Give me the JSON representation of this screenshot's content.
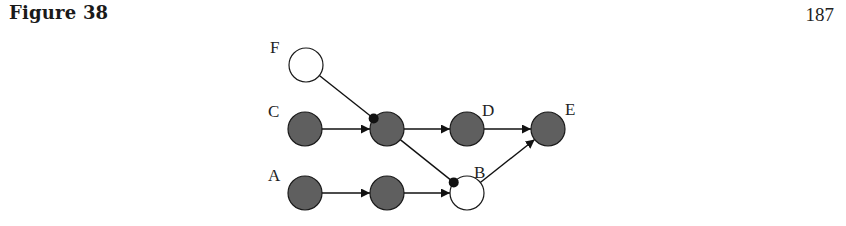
{
  "header": {
    "figure_title": "Figure 38",
    "page_number": "187"
  },
  "diagram": {
    "colors": {
      "filled": "#5f5f5f",
      "empty": "#ffffff",
      "stroke": "#1a1a1a"
    },
    "nodes": [
      {
        "id": "F",
        "label": "F",
        "x": 306,
        "y": 65,
        "filled": false
      },
      {
        "id": "C",
        "label": "C",
        "x": 305,
        "y": 129,
        "filled": true
      },
      {
        "id": "M1",
        "label": "",
        "x": 387,
        "y": 129,
        "filled": true
      },
      {
        "id": "D",
        "label": "D",
        "x": 467,
        "y": 129,
        "filled": true
      },
      {
        "id": "E",
        "label": "E",
        "x": 548,
        "y": 129,
        "filled": true
      },
      {
        "id": "A",
        "label": "A",
        "x": 305,
        "y": 193,
        "filled": true
      },
      {
        "id": "M2",
        "label": "",
        "x": 387,
        "y": 193,
        "filled": true
      },
      {
        "id": "B",
        "label": "B",
        "x": 467,
        "y": 193,
        "filled": false
      }
    ],
    "edges": [
      {
        "from": "F",
        "to": "M1",
        "head": "dot"
      },
      {
        "from": "C",
        "to": "M1",
        "head": "arrow"
      },
      {
        "from": "M1",
        "to": "D",
        "head": "arrow"
      },
      {
        "from": "D",
        "to": "E",
        "head": "arrow"
      },
      {
        "from": "M1",
        "to": "B",
        "head": "dot"
      },
      {
        "from": "A",
        "to": "M2",
        "head": "arrow"
      },
      {
        "from": "M2",
        "to": "B",
        "head": "arrow"
      },
      {
        "from": "B",
        "to": "E",
        "head": "arrow"
      }
    ]
  }
}
